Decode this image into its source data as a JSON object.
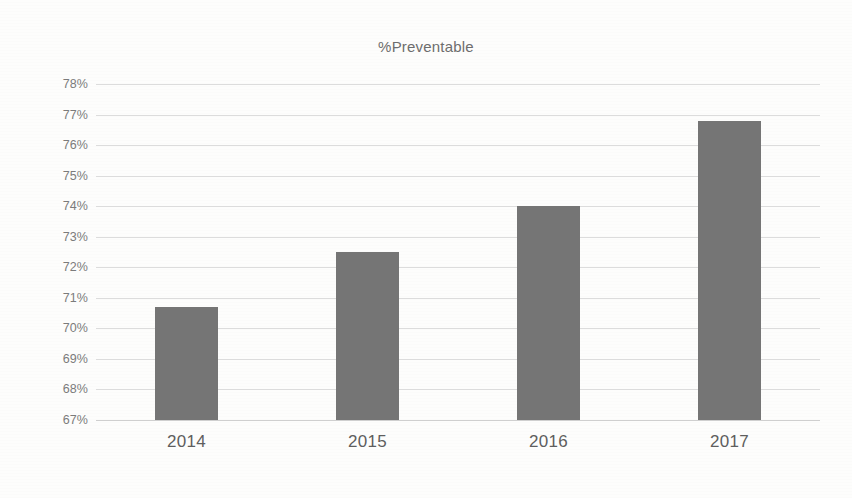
{
  "chart_data": {
    "type": "bar",
    "title": "%Preventable",
    "xlabel": "",
    "ylabel": "",
    "categories": [
      "2014",
      "2015",
      "2016",
      "2017"
    ],
    "values": [
      70.7,
      72.5,
      74.0,
      76.8
    ],
    "value_unit": "%",
    "ylim": [
      67,
      78
    ],
    "ytick_labels": [
      "78%",
      "77%",
      "76%",
      "75%",
      "74%",
      "73%",
      "72%",
      "71%",
      "70%",
      "69%",
      "68%",
      "67%"
    ],
    "ytick_values": [
      78,
      77,
      76,
      75,
      74,
      73,
      72,
      71,
      70,
      69,
      68,
      67
    ],
    "grid": true,
    "legend": false,
    "legend_position": "none",
    "series": [
      {
        "name": "%Preventable",
        "values": [
          70.7,
          72.5,
          74.0,
          76.8
        ]
      }
    ]
  },
  "colors": {
    "bar": "#757575",
    "gridline": "#dcdcdc",
    "baseline": "#cfcfcf",
    "title_text": "#6d6d6d",
    "y_label_text": "#7b7b7b",
    "x_label_text": "#5e5e5e",
    "background": "#fdfdfc"
  }
}
